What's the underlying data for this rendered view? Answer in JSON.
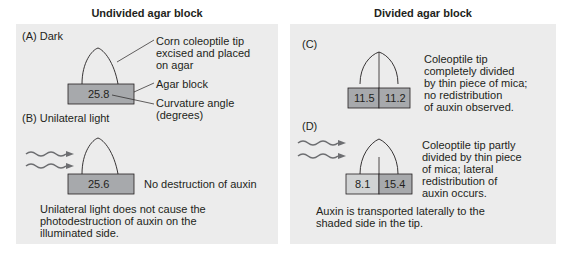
{
  "left_column": {
    "title": "Undivided agar block",
    "panel_a": {
      "label": "(A)  Dark",
      "callout_tip": [
        "Corn coleoptile tip",
        "excised and placed",
        "on agar"
      ],
      "callout_agar": "Agar block",
      "callout_angle": [
        "Curvature angle",
        "(degrees)"
      ],
      "value": "25.8"
    },
    "panel_b": {
      "label": "(B)  Unilateral light",
      "value": "25.6",
      "note": "No destruction of auxin",
      "conclusion": [
        "Unilateral light does not cause the",
        "photodestruction of auxin on the",
        "illuminated side."
      ]
    }
  },
  "right_column": {
    "title": "Divided agar block",
    "panel_c": {
      "label": "(C)",
      "value_left": "11.5",
      "value_right": "11.2",
      "description": [
        "Coleoptile tip",
        "completely divided",
        "by thin piece of mica;",
        "no redistribution",
        "of auxin observed."
      ]
    },
    "panel_d": {
      "label": "(D)",
      "value_left": "8.1",
      "value_right": "15.4",
      "description": [
        "Coleoptile tip partly",
        "divided by thin piece",
        "of mica; lateral",
        "redistribution of",
        "auxin occurs."
      ],
      "conclusion": [
        "Auxin is transported laterally to the",
        "shaded side in the tip."
      ]
    }
  },
  "colors": {
    "panel_bg": "#ececec",
    "agar_block": "#a7a9ac",
    "agar_block_light": "#d1d3d4",
    "line": "#231f20"
  }
}
